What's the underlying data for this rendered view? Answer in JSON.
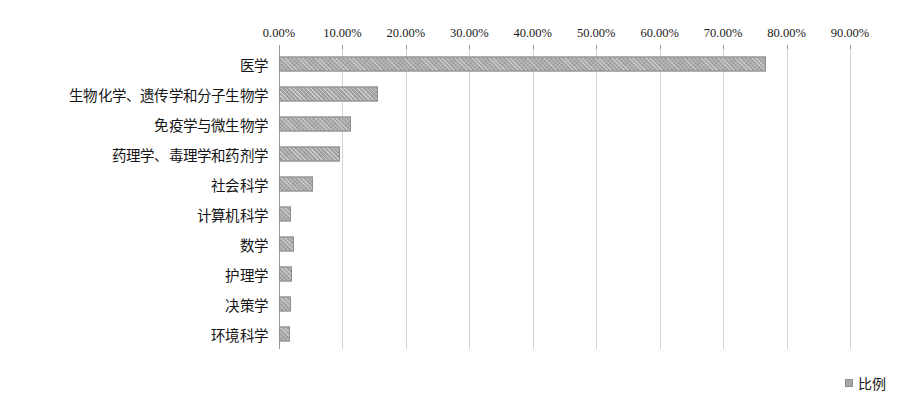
{
  "chart_data": {
    "type": "bar",
    "orientation": "horizontal",
    "title": "",
    "subtitle": "",
    "xlabel": "",
    "ylabel": "",
    "categories": [
      "医学",
      "生物化学、遗传学和分子生物学",
      "免疫学与微生物学",
      "药理学、毒理学和药剂学",
      "社会科学",
      "计算机科学",
      "数学",
      "护理学",
      "决策学",
      "环境科学"
    ],
    "values": [
      76.8,
      15.6,
      11.4,
      9.6,
      5.4,
      1.9,
      2.4,
      2.1,
      1.9,
      1.8
    ],
    "value_format": "percent",
    "xlim": [
      0,
      90
    ],
    "x_tick_values": [
      0,
      10,
      20,
      30,
      40,
      50,
      60,
      70,
      80,
      90
    ],
    "x_tick_labels": [
      "0.00%",
      "10.00%",
      "20.00%",
      "30.00%",
      "40.00%",
      "50.00%",
      "60.00%",
      "70.00%",
      "80.00%",
      "90.00%"
    ],
    "grid": true,
    "grid_axis": "x",
    "legend": {
      "position": "bottom-right",
      "entries": [
        "比例"
      ]
    },
    "series": [
      {
        "name": "比例",
        "color": "#a6a6a6",
        "values": [
          76.8,
          15.6,
          11.4,
          9.6,
          5.4,
          1.9,
          2.4,
          2.1,
          1.9,
          1.8
        ]
      }
    ]
  },
  "legend": {
    "label": "比例",
    "swatch_color": "#a6a6a6"
  },
  "style": {
    "bar_color": "#a6a6a6",
    "bar_border_color": "#8f8f8f",
    "gridline_color": "#d2d2d2",
    "axis_color": "#9a9a9a",
    "text_color": "#141414",
    "background": "#ffffff"
  }
}
